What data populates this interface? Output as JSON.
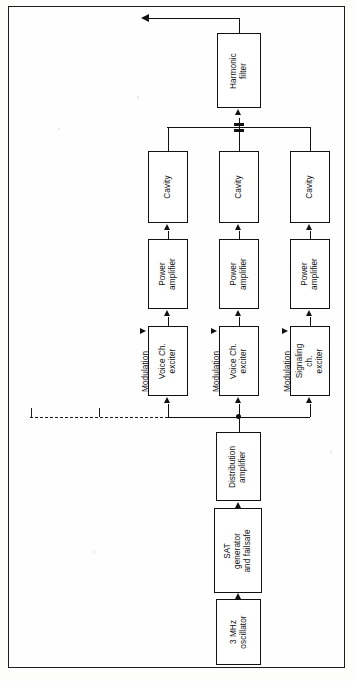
{
  "diagram": {
    "orientation": "rotated-90-ccw",
    "output_label": "",
    "blocks": {
      "harmonic_filter": "Harmonic\nfilter",
      "cavity_1": "Cavity",
      "cavity_2": "Cavity",
      "cavity_3": "Cavity",
      "power_amplifier_1": "Power\namplifier",
      "power_amplifier_2": "Power\namplifier",
      "power_amplifier_3": "Power\namplifier",
      "voice_exciter_1": "Voice Ch.\nexciter",
      "voice_exciter_2": "Voice Ch.\nexciter",
      "signaling_exciter": "Signaling\nch. exciter",
      "distribution_amplifier": "Distribution\namplifier",
      "sat_generator": "SAT generator\nand failsafe",
      "oscillator": "3 MHz\noscillator"
    },
    "captions": {
      "modulation_1": "Modulation",
      "modulation_2": "Modulation",
      "modulation_3": "Modulation"
    },
    "colors": {
      "line": "#111111",
      "frame": "#1c1c1c",
      "paper": "#fefefe",
      "block_fill": "#ffffff"
    }
  }
}
